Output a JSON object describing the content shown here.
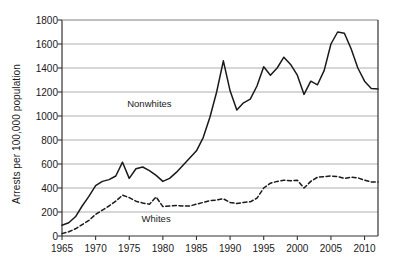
{
  "chart_data": {
    "type": "line",
    "title": "",
    "xlabel": "",
    "ylabel": "Arrests per 100,000 population",
    "xlim": [
      1965,
      2012
    ],
    "ylim": [
      0,
      1800
    ],
    "ytick_step": 200,
    "xtick_step": 5,
    "grid": true,
    "legend_position": "inline-annotation",
    "yticks": [
      0,
      200,
      400,
      600,
      800,
      1000,
      1200,
      1400,
      1600,
      1800
    ],
    "xticks": [
      1965,
      1970,
      1975,
      1980,
      1985,
      1990,
      1995,
      2000,
      2005,
      2010
    ],
    "x": [
      1965,
      1966,
      1967,
      1968,
      1969,
      1970,
      1971,
      1972,
      1973,
      1974,
      1975,
      1976,
      1977,
      1978,
      1979,
      1980,
      1981,
      1982,
      1983,
      1984,
      1985,
      1986,
      1987,
      1988,
      1989,
      1990,
      1991,
      1992,
      1993,
      1994,
      1995,
      1996,
      1997,
      1998,
      1999,
      2000,
      2001,
      2002,
      2003,
      2004,
      2005,
      2006,
      2007,
      2008,
      2009,
      2010,
      2011,
      2012
    ],
    "series": [
      {
        "name": "Nonwhites",
        "style": "solid",
        "color": "#1a1a1a",
        "label_x": 1978,
        "label_y": 1110,
        "values": [
          90,
          110,
          160,
          250,
          330,
          420,
          455,
          470,
          500,
          615,
          480,
          560,
          575,
          545,
          505,
          455,
          480,
          530,
          590,
          650,
          710,
          820,
          990,
          1200,
          1460,
          1210,
          1050,
          1110,
          1140,
          1250,
          1410,
          1340,
          1400,
          1490,
          1430,
          1340,
          1180,
          1290,
          1260,
          1380,
          1600,
          1700,
          1690,
          1560,
          1400,
          1290,
          1230,
          1225
        ]
      },
      {
        "name": "Whites",
        "style": "dashed",
        "color": "#1a1a1a",
        "label_x": 1979,
        "label_y": 150,
        "values": [
          20,
          35,
          60,
          95,
          130,
          180,
          215,
          250,
          290,
          340,
          320,
          290,
          275,
          265,
          325,
          245,
          250,
          255,
          250,
          250,
          265,
          280,
          295,
          300,
          310,
          280,
          270,
          280,
          285,
          315,
          400,
          440,
          455,
          465,
          460,
          465,
          400,
          455,
          490,
          495,
          500,
          495,
          480,
          490,
          485,
          465,
          450,
          450
        ]
      }
    ],
    "annotations": [
      {
        "text": "Nonwhites"
      },
      {
        "text": "Whites"
      }
    ]
  },
  "axis": {
    "ylabel_text": "Arrests per 100,000 population",
    "ytick_labels": [
      "1800",
      "1600",
      "1400",
      "1200",
      "1000",
      "800",
      "600",
      "400",
      "200",
      "0"
    ],
    "xtick_labels": [
      "1965",
      "1970",
      "1975",
      "1980",
      "1985",
      "1990",
      "1995",
      "2000",
      "2005",
      "2010"
    ]
  },
  "labels": {
    "nonwhites": "Nonwhites",
    "whites": "Whites"
  },
  "colors": {
    "background": "#ffffff",
    "line": "#1a1a1a",
    "grid": "#9a9a9a",
    "axis": "#333333",
    "text": "#1a1a1a"
  }
}
